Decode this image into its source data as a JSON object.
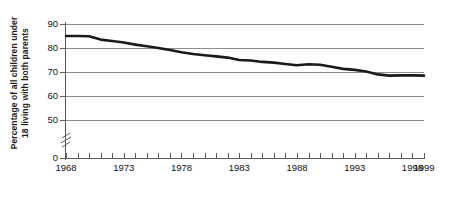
{
  "chart_data": {
    "type": "line",
    "title": "",
    "subtitle": "",
    "xlabel": "",
    "ylabel": "Percentage of all children under 18 living with both parents",
    "ylabel_line1": "Percentage of all children under",
    "ylabel_line2": "18 living with both parents",
    "x": [
      1968,
      1969,
      1970,
      1971,
      1972,
      1973,
      1974,
      1975,
      1976,
      1977,
      1978,
      1979,
      1980,
      1981,
      1982,
      1983,
      1984,
      1985,
      1986,
      1987,
      1988,
      1989,
      1990,
      1991,
      1992,
      1993,
      1994,
      1995,
      1996,
      1997,
      1998,
      1999
    ],
    "values": [
      85.0,
      85.0,
      84.9,
      83.5,
      82.9,
      82.3,
      81.4,
      80.7,
      80.0,
      79.2,
      78.2,
      77.5,
      77.0,
      76.5,
      76.0,
      75.0,
      74.8,
      74.2,
      73.9,
      73.3,
      72.8,
      73.2,
      73.0,
      72.2,
      71.3,
      70.9,
      70.2,
      69.0,
      68.5,
      68.6,
      68.6,
      68.5
    ],
    "series": [
      {
        "name": "Percentage of all children under 18 living with both parents",
        "color": "#1a1a1a",
        "values": [
          85.0,
          85.0,
          84.9,
          83.5,
          82.9,
          82.3,
          81.4,
          80.7,
          80.0,
          79.2,
          78.2,
          77.5,
          77.0,
          76.5,
          76.0,
          75.0,
          74.8,
          74.2,
          73.9,
          73.3,
          72.8,
          73.2,
          73.0,
          72.2,
          71.3,
          70.9,
          70.2,
          69.0,
          68.5,
          68.6,
          68.6,
          68.5
        ]
      }
    ],
    "ylim": [
      50,
      90
    ],
    "yticks": [
      90,
      80,
      70,
      60,
      50,
      0
    ],
    "y_axis_break": true,
    "y_axis_break_between": [
      0,
      50
    ],
    "xlim": [
      1968,
      1999
    ],
    "xticks": [
      1968,
      1969,
      1970,
      1971,
      1972,
      1973,
      1974,
      1975,
      1976,
      1977,
      1978,
      1979,
      1980,
      1981,
      1982,
      1983,
      1984,
      1985,
      1986,
      1987,
      1988,
      1989,
      1990,
      1991,
      1992,
      1993,
      1994,
      1995,
      1996,
      1997,
      1998,
      1999
    ],
    "xtick_labels": [
      {
        "value": 1968,
        "label": "1968"
      },
      {
        "value": 1973,
        "label": "1973"
      },
      {
        "value": 1978,
        "label": "1978"
      },
      {
        "value": 1983,
        "label": "1983"
      },
      {
        "value": 1988,
        "label": "1988"
      },
      {
        "value": 1993,
        "label": "1993"
      },
      {
        "value": 1998,
        "label": "1998"
      },
      {
        "value": 1999,
        "label": "1999"
      }
    ],
    "grid": true,
    "grid_axis": "y",
    "legend": false,
    "legend_position": "none",
    "line_color": "#1a1a1a",
    "line_width": 2.6,
    "background": "#ffffff",
    "gridline_color": "#8d8d8d",
    "axis_color": "#5a5a5a"
  }
}
